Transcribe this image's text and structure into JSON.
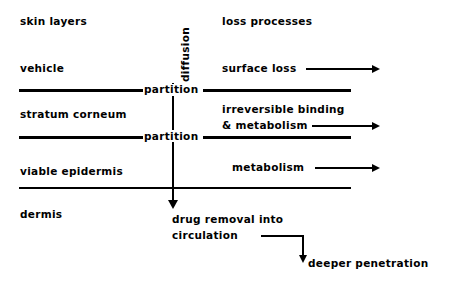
{
  "diagram": {
    "title_row": {
      "left_header": "skin layers",
      "right_header": "loss processes",
      "axis_label": "diffusion"
    },
    "skin_layers": [
      {
        "name": "vehicle"
      },
      {
        "name": "stratum corneum"
      },
      {
        "name": "viable epidermis"
      },
      {
        "name": "dermis"
      }
    ],
    "boundaries": [
      {
        "label": "partition"
      },
      {
        "label": "partition"
      },
      {
        "label": ""
      }
    ],
    "loss_processes": [
      {
        "label": "surface loss"
      },
      {
        "label_line1": "irreversible binding",
        "label_line2": "& metabolism"
      },
      {
        "label": "metabolism"
      }
    ],
    "outcomes": {
      "drug_removal_line1": "drug removal into",
      "drug_removal_line2": "circulation",
      "deeper_penetration": "deeper penetration"
    },
    "colors": {
      "ink": "#000000",
      "background": "#ffffff"
    }
  }
}
